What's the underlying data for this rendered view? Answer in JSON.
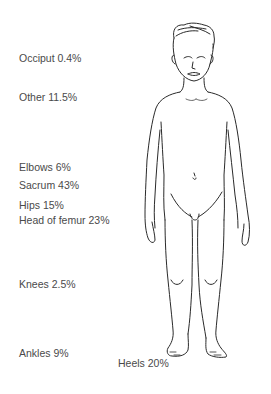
{
  "diagram": {
    "text_color": "#4a4a4a",
    "line_color": "#2a2a2a",
    "labels": [
      {
        "id": "occiput",
        "text": "Occiput 0.4%",
        "x": 19,
        "y": 53
      },
      {
        "id": "other",
        "text": "Other 11.5%",
        "x": 19,
        "y": 92
      },
      {
        "id": "elbows",
        "text": "Elbows 6%",
        "x": 19,
        "y": 162
      },
      {
        "id": "sacrum",
        "text": "Sacrum 43%",
        "x": 19,
        "y": 180
      },
      {
        "id": "hips",
        "text": "Hips 15%",
        "x": 19,
        "y": 200
      },
      {
        "id": "head-of-femur",
        "text": "Head of femur 23%",
        "x": 19,
        "y": 215
      },
      {
        "id": "knees",
        "text": "Knees 2.5%",
        "x": 19,
        "y": 279
      },
      {
        "id": "ankles",
        "text": "Ankles 9%",
        "x": 19,
        "y": 348
      },
      {
        "id": "heels",
        "text": "Heels 20%",
        "x": 118,
        "y": 358
      }
    ]
  }
}
